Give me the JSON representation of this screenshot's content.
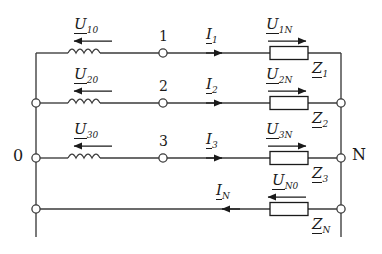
{
  "diagram": {
    "stroke_color": "#3a3a3a",
    "text_color": "#1a1a1a",
    "background": "#ffffff"
  },
  "terminals": {
    "left_label": "0",
    "right_label": "N"
  },
  "nodes": [
    {
      "id": "node-1",
      "label": "1"
    },
    {
      "id": "node-2",
      "label": "2"
    },
    {
      "id": "node-3",
      "label": "3"
    }
  ],
  "sources": [
    {
      "id": "source-1",
      "symbol": "U",
      "subscript": "10",
      "direction": "left"
    },
    {
      "id": "source-2",
      "symbol": "U",
      "subscript": "20",
      "direction": "left"
    },
    {
      "id": "source-3",
      "symbol": "U",
      "subscript": "30",
      "direction": "left"
    }
  ],
  "currents": [
    {
      "id": "current-1",
      "symbol": "I",
      "subscript": "1",
      "direction": "right"
    },
    {
      "id": "current-2",
      "symbol": "I",
      "subscript": "2",
      "direction": "right"
    },
    {
      "id": "current-3",
      "symbol": "I",
      "subscript": "3",
      "direction": "right"
    },
    {
      "id": "current-n",
      "symbol": "I",
      "subscript": "N",
      "direction": "left"
    }
  ],
  "load_voltages": [
    {
      "id": "voltage-1n",
      "symbol": "U",
      "subscript": "1N",
      "direction": "right"
    },
    {
      "id": "voltage-2n",
      "symbol": "U",
      "subscript": "2N",
      "direction": "right"
    },
    {
      "id": "voltage-3n",
      "symbol": "U",
      "subscript": "3N",
      "direction": "right"
    },
    {
      "id": "voltage-n0",
      "symbol": "U",
      "subscript": "N0",
      "direction": "left"
    }
  ],
  "impedances": [
    {
      "id": "impedance-1",
      "symbol": "Z",
      "subscript": "1"
    },
    {
      "id": "impedance-2",
      "symbol": "Z",
      "subscript": "2"
    },
    {
      "id": "impedance-3",
      "symbol": "Z",
      "subscript": "3"
    },
    {
      "id": "impedance-n",
      "symbol": "Z",
      "subscript": "N"
    }
  ]
}
